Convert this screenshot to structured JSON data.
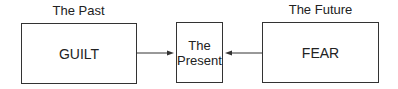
{
  "diagram": {
    "past": {
      "heading": "The Past",
      "content": "GUILT"
    },
    "present": {
      "line1": "The",
      "line2": "Present"
    },
    "future": {
      "heading": "The Future",
      "content": "FEAR"
    }
  }
}
